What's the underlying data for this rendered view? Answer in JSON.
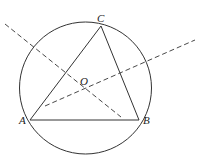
{
  "diagram": {
    "type": "geometry",
    "stroke_color": "#333333",
    "circle": {
      "cx": 85.5,
      "cy": 88,
      "r": 66
    },
    "points": {
      "A": {
        "label": "A",
        "x": 30,
        "y": 120
      },
      "B": {
        "label": "B",
        "x": 139,
        "y": 120
      },
      "C": {
        "label": "C",
        "x": 101,
        "y": 26
      },
      "O": {
        "label": "O",
        "x": 86,
        "y": 88
      }
    },
    "dashed_lines": [
      {
        "name": "perpendicular-bisector-AC",
        "x1": 5,
        "y1": 24,
        "x2": 121,
        "y2": 117
      },
      {
        "name": "perpendicular-bisector-BC",
        "x1": 45,
        "y1": 106,
        "x2": 195,
        "y2": 40
      }
    ]
  }
}
